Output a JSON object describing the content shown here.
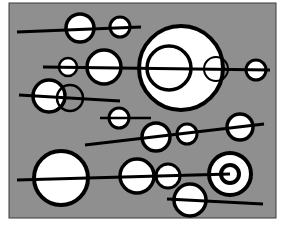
{
  "artwork": {
    "description": "Abstract black-and-white composition of circles threaded on horizontal lines over a gray panel",
    "colors": {
      "page": "#ffffff",
      "panel": "#8f8f8f",
      "panel_border": "#3a3a3a",
      "fill": "#ffffff",
      "stroke": "#000000"
    },
    "panel": {
      "x": 9,
      "y": 3,
      "w": 267,
      "h": 215
    },
    "lines": [
      {
        "x1": 17,
        "y1": 32,
        "x2": 141,
        "y2": 27,
        "w": 3
      },
      {
        "x1": 43,
        "y1": 67,
        "x2": 270,
        "y2": 70,
        "w": 3
      },
      {
        "x1": 19,
        "y1": 95,
        "x2": 120,
        "y2": 101,
        "w": 3
      },
      {
        "x1": 100,
        "y1": 118,
        "x2": 151,
        "y2": 118,
        "w": 2.5
      },
      {
        "x1": 85,
        "y1": 145,
        "x2": 264,
        "y2": 124,
        "w": 3
      },
      {
        "x1": 17,
        "y1": 180,
        "x2": 230,
        "y2": 174,
        "w": 3
      },
      {
        "x1": 167,
        "y1": 199,
        "x2": 263,
        "y2": 204,
        "w": 3
      }
    ],
    "circles": [
      {
        "cx": 80,
        "cy": 28,
        "r": 14,
        "w": 3.5
      },
      {
        "cx": 120,
        "cy": 27,
        "r": 10,
        "w": 3
      },
      {
        "cx": 181,
        "cy": 68,
        "r": 42,
        "w": 4
      },
      {
        "cx": 68,
        "cy": 67,
        "r": 9,
        "w": 2.5
      },
      {
        "cx": 104,
        "cy": 67,
        "r": 17,
        "w": 3.5
      },
      {
        "cx": 169,
        "cy": 68,
        "r": 22,
        "w": 3.5,
        "hollow": true
      },
      {
        "cx": 216,
        "cy": 69,
        "r": 12,
        "w": 2,
        "hollow": true
      },
      {
        "cx": 256,
        "cy": 70,
        "r": 10,
        "w": 3
      },
      {
        "cx": 49,
        "cy": 96,
        "r": 16,
        "w": 3.5
      },
      {
        "cx": 70,
        "cy": 98,
        "r": 13,
        "w": 2.5,
        "hollow": true
      },
      {
        "cx": 119,
        "cy": 118,
        "r": 10,
        "w": 3
      },
      {
        "cx": 156,
        "cy": 137,
        "r": 14,
        "w": 3.5
      },
      {
        "cx": 187,
        "cy": 134,
        "r": 10,
        "w": 3
      },
      {
        "cx": 240,
        "cy": 127,
        "r": 13,
        "w": 3.5
      },
      {
        "cx": 61,
        "cy": 178,
        "r": 27,
        "w": 4
      },
      {
        "cx": 137,
        "cy": 176,
        "r": 17,
        "w": 3.5
      },
      {
        "cx": 168,
        "cy": 176,
        "r": 12,
        "w": 3
      },
      {
        "cx": 230,
        "cy": 174,
        "r": 21,
        "w": 4
      },
      {
        "cx": 230,
        "cy": 174,
        "r": 9,
        "w": 4,
        "hollow": true
      },
      {
        "cx": 190,
        "cy": 200,
        "r": 16,
        "w": 3.5
      }
    ]
  }
}
